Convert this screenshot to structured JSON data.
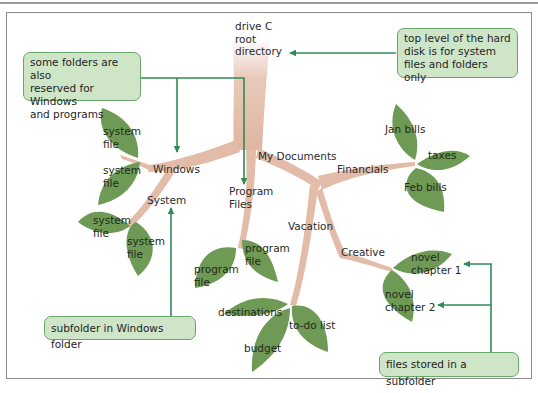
{
  "colors": {
    "branch": "#e2bca8",
    "leaf": "#6f9a55",
    "leaf_dark": "#5b8444",
    "arrow": "#2e8b57",
    "callout_bg": "#cfe5c8",
    "callout_border": "#6aa56a",
    "frame": "#8c8c8c"
  },
  "tree": {
    "root": {
      "line1": "drive C",
      "line2": "root",
      "line3": "directory"
    },
    "folders": {
      "windows": "Windows",
      "system": "System",
      "program_files_1": "Program",
      "program_files_2": "Files",
      "my_documents": "My Documents",
      "financials": "Financials",
      "vacation": "Vacation",
      "creative": "Creative"
    },
    "files": {
      "system_file_1": [
        "system",
        "file"
      ],
      "system_file_2": [
        "system",
        "file"
      ],
      "system_file_3": [
        "system",
        "file"
      ],
      "system_file_4": [
        "system",
        "file"
      ],
      "program_file_1": [
        "program",
        "file"
      ],
      "program_file_2": [
        "program",
        "file"
      ],
      "jan_bills": "Jan bills",
      "taxes": "taxes",
      "feb_bills": "Feb bills",
      "destinations": "destinations",
      "budget": "budget",
      "todo_list": "to-do list",
      "novel_chapter_1": [
        "novel",
        "chapter 1"
      ],
      "novel_chapter_2": [
        "novel",
        "chapter 2"
      ]
    }
  },
  "callouts": {
    "reserved": {
      "line1": "some folders are also",
      "line2": "reserved for Windows",
      "line3": "and programs"
    },
    "top_level": {
      "line1": "top level of the hard",
      "line2": "disk is for system",
      "line3": "files and folders only"
    },
    "subfolder_windows": "subfolder in Windows folder",
    "files_subfolder": "files stored in a subfolder"
  }
}
